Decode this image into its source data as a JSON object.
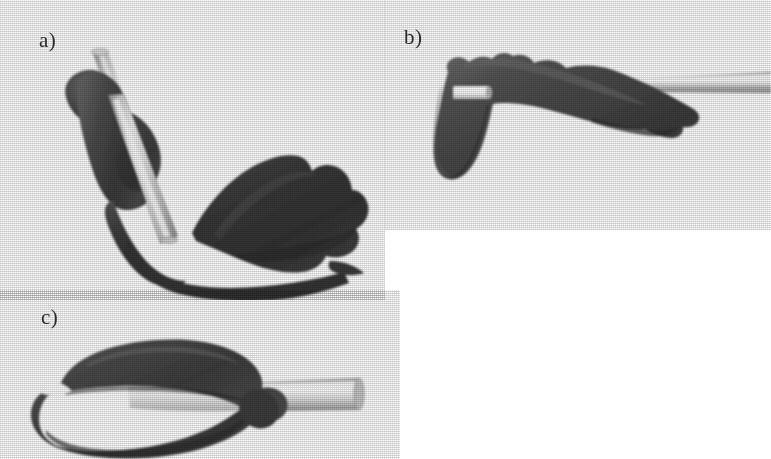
{
  "figure": {
    "background_color": "#ffffff",
    "width": 771,
    "height": 459,
    "label_color": "#2b2b2b"
  },
  "palette": {
    "bone_dark": "#3c3c3c",
    "bone_mid": "#585858",
    "bone_light": "#7a7a7a",
    "bone_shadow": "#2a2a2a",
    "rod_light": "#e8e8e8",
    "rod_mid": "#c9c9c9",
    "rod_dark": "#9a9a9a",
    "rod_highlight": "#ffffff",
    "background": "#ffffff"
  },
  "panels": [
    {
      "id": "a",
      "label": "a)",
      "label_x": 39,
      "label_y": 30,
      "view": "oblique-hooked-view",
      "objects": [
        "bone-specimen",
        "rod-implant"
      ],
      "rod_orientation": "steep-diagonal-top-left",
      "rod_visible_ends": 1
    },
    {
      "id": "b",
      "label": "b)",
      "label_x": 404,
      "label_y": 27,
      "view": "superior-wedge-view",
      "objects": [
        "bone-specimen",
        "rod-implant",
        "rod-stub-highlight"
      ],
      "rod_orientation": "horizontal-exits-right",
      "rod_visible_ends": 2
    },
    {
      "id": "c",
      "label": "c)",
      "label_x": 41,
      "label_y": 307,
      "view": "lateral-profile-view",
      "objects": [
        "bone-specimen",
        "rod-implant",
        "rod-tip-wedge"
      ],
      "rod_orientation": "horizontal-exits-right",
      "rod_visible_ends": 2
    }
  ]
}
